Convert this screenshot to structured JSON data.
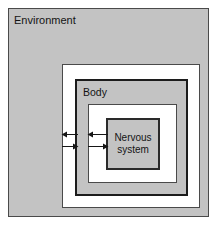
{
  "diagram": {
    "type": "nested-boxes",
    "levels": [
      {
        "id": "environment",
        "label": "Environment",
        "fill": "#c3c3c3",
        "border": "#4a4a4a",
        "label_position": "top-left"
      },
      {
        "id": "gap-outer",
        "label": "",
        "fill": "#ffffff",
        "border": "#4a4a4a",
        "label_position": "none"
      },
      {
        "id": "body",
        "label": "Body",
        "fill": "#c3c3c3",
        "border": "#1c1c1c",
        "label_position": "top-left"
      },
      {
        "id": "gap-inner",
        "label": "",
        "fill": "#ffffff",
        "border": "#4a4a4a",
        "label_position": "none"
      },
      {
        "id": "nervous-system",
        "label": "Nervous system",
        "label_line1": "Nervous",
        "label_line2": "system",
        "fill": "#c3c3c3",
        "border": "#2a2a2a",
        "label_position": "center"
      }
    ],
    "arrows": [
      {
        "id": "environment-to-body-inward",
        "direction": "left",
        "between": "environment-gap",
        "row": "top"
      },
      {
        "id": "body-to-environment-outward",
        "direction": "right",
        "between": "environment-gap",
        "row": "bottom"
      },
      {
        "id": "body-to-nervous-system-inward",
        "direction": "left",
        "between": "body-gap",
        "row": "top"
      },
      {
        "id": "nervous-system-to-body-outward",
        "direction": "right",
        "between": "body-gap",
        "row": "bottom"
      }
    ],
    "colors": {
      "gray_fill": "#c3c3c3",
      "white_fill": "#ffffff",
      "thin_border": "#4a4a4a",
      "thick_border": "#1c1c1c",
      "text": "#141414",
      "arrow": "#161616",
      "page_background": "#ffffff"
    }
  }
}
